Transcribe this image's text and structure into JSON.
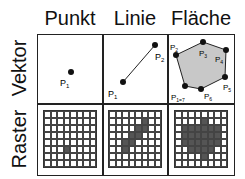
{
  "columns": [
    "Punkt",
    "Linie",
    "Fläche"
  ],
  "rows": [
    "Vektor",
    "Raster"
  ],
  "vector": {
    "point": {
      "label": "P",
      "sub": "1"
    },
    "line": {
      "labels": [
        {
          "label": "P",
          "sub": "1"
        },
        {
          "label": "P",
          "sub": "2"
        }
      ]
    },
    "area": {
      "labels": [
        {
          "label": "P",
          "sub": "1=7"
        },
        {
          "label": "P",
          "sub": "2"
        },
        {
          "label": "P",
          "sub": "3"
        },
        {
          "label": "P",
          "sub": "4"
        },
        {
          "label": "P",
          "sub": "5"
        },
        {
          "label": "P",
          "sub": "6"
        }
      ],
      "fill": "#c8c8c8"
    }
  },
  "raster": {
    "size": 8,
    "fill_color": "#555555",
    "point": [
      [
        5,
        3
      ]
    ],
    "line": [
      [
        1,
        5
      ],
      [
        2,
        4
      ],
      [
        2,
        5
      ],
      [
        3,
        3
      ],
      [
        3,
        4
      ],
      [
        4,
        2
      ],
      [
        4,
        3
      ],
      [
        5,
        2
      ]
    ],
    "area": [
      [
        1,
        4
      ],
      [
        2,
        1
      ],
      [
        2,
        2
      ],
      [
        2,
        3
      ],
      [
        2,
        4
      ],
      [
        2,
        5
      ],
      [
        2,
        6
      ],
      [
        3,
        1
      ],
      [
        3,
        2
      ],
      [
        3,
        3
      ],
      [
        3,
        4
      ],
      [
        3,
        5
      ],
      [
        3,
        6
      ],
      [
        4,
        1
      ],
      [
        4,
        2
      ],
      [
        4,
        3
      ],
      [
        4,
        4
      ],
      [
        4,
        5
      ],
      [
        4,
        6
      ],
      [
        5,
        2
      ],
      [
        5,
        3
      ],
      [
        5,
        4
      ],
      [
        5,
        5
      ],
      [
        6,
        4
      ]
    ]
  }
}
